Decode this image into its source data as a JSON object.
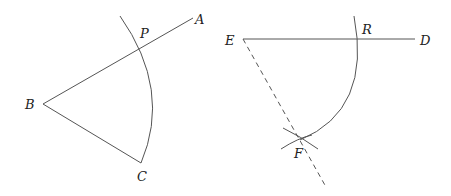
{
  "figure_left": {
    "labels": {
      "A": "A",
      "B": "B",
      "C": "C",
      "P": "P"
    }
  },
  "figure_right": {
    "labels": {
      "D": "D",
      "E": "E",
      "F": "F",
      "R": "R"
    }
  },
  "colors": {
    "line": "#555555",
    "text": "#222222",
    "background": "#ffffff"
  }
}
